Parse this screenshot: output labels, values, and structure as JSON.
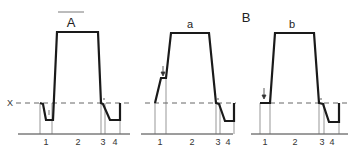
{
  "figure": {
    "section_labels": [
      "A",
      "B"
    ],
    "axis_marker": "X",
    "panels": [
      {
        "id": "A",
        "title": "A",
        "phase_labels": [
          "1",
          "2",
          "3",
          "4"
        ],
        "has_arrow": false
      },
      {
        "id": "a",
        "title": "a",
        "phase_labels": [
          "1",
          "2",
          "3",
          "4"
        ],
        "has_arrow": true
      },
      {
        "id": "b",
        "title": "b",
        "section": "B",
        "phase_labels": [
          "1",
          "2",
          "3",
          "4"
        ],
        "has_arrow": true
      }
    ]
  }
}
